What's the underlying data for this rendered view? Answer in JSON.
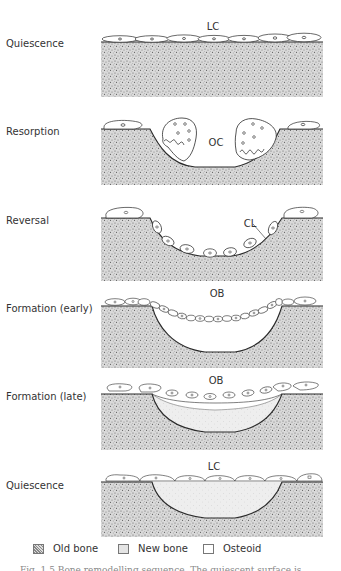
{
  "figure": {
    "type": "bone-remodelling-cycle",
    "stages": [
      {
        "label": "Quiescence",
        "annotation": "LC"
      },
      {
        "label": "Resorption",
        "annotation": "OC"
      },
      {
        "label": "Reversal",
        "annotation": "CL"
      },
      {
        "label": "Formation (early)",
        "annotation": "OB"
      },
      {
        "label": "Formation (late)",
        "annotation": "OB"
      },
      {
        "label": "Quiescence",
        "annotation": "LC"
      }
    ],
    "legend": [
      {
        "label": "Old bone",
        "swatch": "stippled"
      },
      {
        "label": "New bone",
        "swatch": "light-gray"
      },
      {
        "label": "Osteoid",
        "swatch": "white"
      }
    ],
    "caption_fragment": "Fig. 1.5  Bone remodelling sequence. The quiescent surface is"
  },
  "colors": {
    "line": "#2a2a2a",
    "old_bone_bg": "#d8d8d8",
    "new_bone_bg": "#ececec",
    "background": "#ffffff"
  }
}
